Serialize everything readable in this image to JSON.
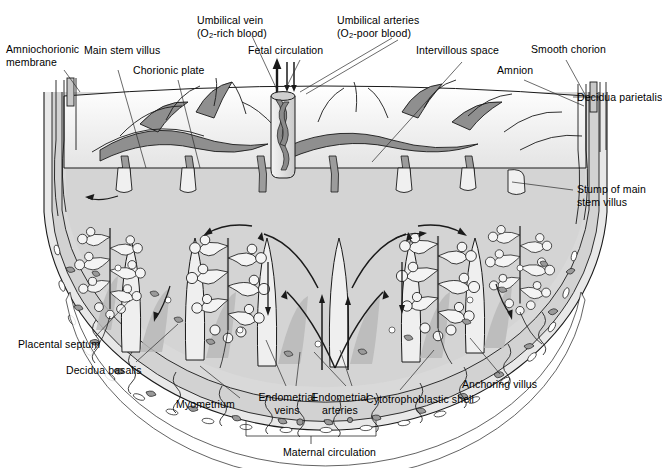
{
  "figure": {
    "kind": "anatomical-diagram",
    "background_color": "#ffffff",
    "line_color": "#1a1a1a",
    "palette": {
      "intervillous_space": "#d9d9d9",
      "villus_fill": "#f2f2f2",
      "vessel_dark": "#8c8c8c",
      "vessel_mid": "#bfbfbf",
      "decidua": "#cccccc",
      "myometrium": "#e6e6e6",
      "septum_shadow": "#b3b3b3",
      "chorionic_plate": "#ededed",
      "cord_fill": "#e0e0e0"
    }
  },
  "labels": [
    {
      "id": "amniochorionic-membrane",
      "line1": "Amniochorionic",
      "line2": "membrane",
      "x": 6,
      "y": 43,
      "align": "left"
    },
    {
      "id": "main-stem-villus",
      "line1": "Main stem villus",
      "line2": "",
      "x": 84,
      "y": 44,
      "align": "left"
    },
    {
      "id": "chorionic-plate",
      "line1": "Chorionic plate",
      "line2": "",
      "x": 133,
      "y": 64,
      "align": "left"
    },
    {
      "id": "umbilical-vein",
      "line1": "Umbilical vein",
      "line2": "(O2-rich blood)",
      "x": 197,
      "y": 14,
      "align": "left"
    },
    {
      "id": "fetal-circulation",
      "line1": "Fetal circulation",
      "line2": "",
      "x": 248,
      "y": 44,
      "align": "left"
    },
    {
      "id": "umbilical-arteries",
      "line1": "Umbilical arteries",
      "line2": "(O2-poor blood)",
      "x": 337,
      "y": 14,
      "align": "left"
    },
    {
      "id": "intervillous-space",
      "line1": "Intervillous space",
      "line2": "",
      "x": 416,
      "y": 44,
      "align": "left"
    },
    {
      "id": "amnion",
      "line1": "Amnion",
      "line2": "",
      "x": 497,
      "y": 64,
      "align": "left"
    },
    {
      "id": "smooth-chorion",
      "line1": "Smooth chorion",
      "line2": "",
      "x": 531,
      "y": 43,
      "align": "left"
    },
    {
      "id": "decidua-parietalis",
      "line1": "Decidua parietalis",
      "line2": "",
      "x": 577,
      "y": 93,
      "align": "left"
    },
    {
      "id": "stump-of-main-stem-villus",
      "line1": "Stump of main",
      "line2": "stem villus",
      "x": 577,
      "y": 185,
      "align": "left"
    },
    {
      "id": "placental-septum",
      "line1": "Placental septum",
      "line2": "",
      "x": 18,
      "y": 338,
      "align": "left"
    },
    {
      "id": "decidua-basalis",
      "line1": "Decidua basalis",
      "line2": "",
      "x": 66,
      "y": 364,
      "align": "left"
    },
    {
      "id": "myometrium",
      "line1": "Myometrium",
      "line2": "",
      "x": 176,
      "y": 398,
      "align": "left"
    },
    {
      "id": "endometrial-veins",
      "line1": "Endometrial",
      "line2": "veins",
      "x": 264,
      "y": 391,
      "align": "center"
    },
    {
      "id": "endometrial-arteries",
      "line1": "Endometrial",
      "line2": "arteries",
      "x": 327,
      "y": 391,
      "align": "center"
    },
    {
      "id": "cytotrophoblastic-shell",
      "line1": "Cytotrophoblastic shell",
      "line2": "",
      "x": 366,
      "y": 393,
      "align": "left"
    },
    {
      "id": "anchoring-villus",
      "line1": "Anchoring villus",
      "line2": "",
      "x": 462,
      "y": 378,
      "align": "left"
    },
    {
      "id": "maternal-circulation",
      "line1": "Maternal circulation",
      "line2": "",
      "x": 283,
      "y": 446,
      "align": "left"
    }
  ],
  "oxygen_subscript": "2",
  "flow_arrows": {
    "umbilical_vein_direction": "up (out of placenta, O2-rich)",
    "umbilical_artery_direction": "down (into placenta, O2-poor)",
    "maternal_pattern": "fountain: arterial jets spurt up from endometrial arteries into intervillous space, then sweep outward and drain down into endometrial veins"
  }
}
